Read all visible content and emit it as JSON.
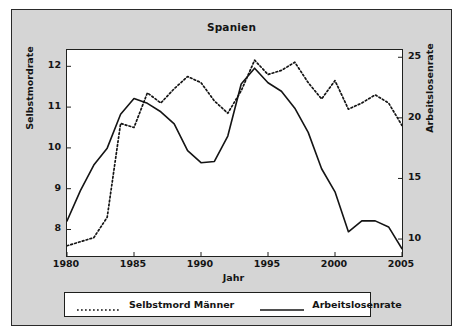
{
  "figure": {
    "title": "Spanien",
    "panel_bg": "#d5d5d5",
    "plot_bg": "#ffffff",
    "line_color": "#141414"
  },
  "axes": {
    "x": {
      "label": "Jahr",
      "ticks": [
        "1980",
        "1985",
        "1990",
        "1995",
        "2000",
        "2005"
      ],
      "range": [
        1980,
        2005
      ]
    },
    "y_left": {
      "label": "Selbstmordrate",
      "ticks": [
        "8",
        "9",
        "10",
        "11",
        "12"
      ],
      "range": [
        7.35,
        12.4
      ]
    },
    "y_right": {
      "label": "Arbeitslosenrate",
      "ticks": [
        "10",
        "15",
        "20",
        "25"
      ],
      "range": [
        8.6,
        25.6
      ]
    }
  },
  "legend": {
    "items": [
      {
        "label": "Selbstmord Männer",
        "style": "dotted"
      },
      {
        "label": "Arbeitslosenrate",
        "style": "solid"
      }
    ]
  },
  "chart_data": {
    "type": "line",
    "title": "Spanien",
    "xlabel": "Jahr",
    "ylabel": "Selbstmordrate",
    "ylabel_secondary": "Arbeitslosenrate",
    "xlim": [
      1980,
      2005
    ],
    "ylim": [
      7.35,
      12.4
    ],
    "ylim_secondary": [
      8.6,
      25.6
    ],
    "grid": false,
    "legend_position": "below-axes",
    "x": [
      1980,
      1981,
      1982,
      1983,
      1984,
      1985,
      1986,
      1987,
      1988,
      1989,
      1990,
      1991,
      1992,
      1993,
      1994,
      1995,
      1996,
      1997,
      1998,
      1999,
      2000,
      2001,
      2002,
      2003,
      2004,
      2005
    ],
    "series": [
      {
        "name": "Selbstmord Männer",
        "axis": "left",
        "style": "dotted",
        "ylabel": "Selbstmordrate",
        "values": [
          7.6,
          7.7,
          7.8,
          8.3,
          10.6,
          10.5,
          11.35,
          11.1,
          11.45,
          11.75,
          11.6,
          11.15,
          10.85,
          11.4,
          12.15,
          11.8,
          11.9,
          12.1,
          11.6,
          11.2,
          11.65,
          10.95,
          11.1,
          11.3,
          11.1,
          10.55
        ]
      },
      {
        "name": "Arbeitslosenrate",
        "axis": "right",
        "style": "solid",
        "ylabel": "Arbeitslosenrate",
        "values": [
          11.5,
          14.0,
          16.1,
          17.5,
          20.3,
          21.6,
          21.2,
          20.5,
          19.5,
          17.3,
          16.3,
          16.4,
          18.5,
          22.8,
          24.1,
          22.9,
          22.2,
          20.8,
          18.8,
          15.8,
          13.9,
          10.6,
          11.5,
          11.5,
          11.0,
          9.2
        ]
      }
    ]
  }
}
